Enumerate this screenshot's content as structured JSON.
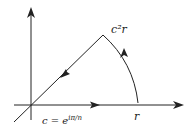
{
  "diagram": {
    "labels": {
      "top_point": "c²r",
      "real_point": "r",
      "definition": "c = e",
      "definition_exponent": "iπ/n"
    },
    "colors": {
      "stroke": "#222222",
      "background": "#ffffff"
    }
  }
}
